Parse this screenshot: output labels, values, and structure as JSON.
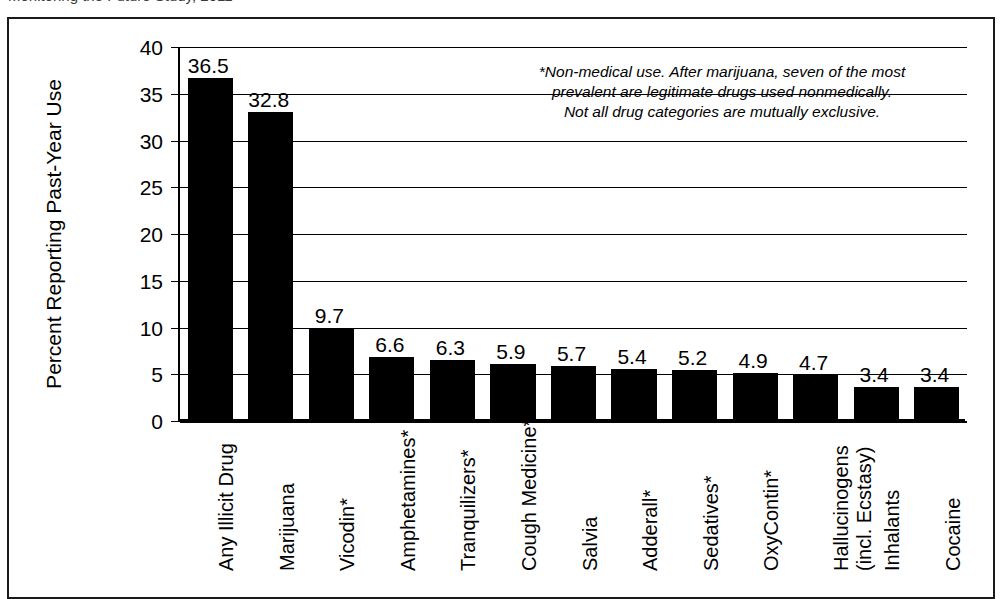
{
  "caption": {
    "text": "Monitoring the Future Study, 2011"
  },
  "chart_data": {
    "type": "bar",
    "title": "",
    "xlabel": "",
    "ylabel": "Percent Reporting Past-Year Use",
    "ylim": [
      0,
      40
    ],
    "ytick_step": 5,
    "yticks": [
      "0",
      "5",
      "10",
      "15",
      "20",
      "25",
      "30",
      "35",
      "40"
    ],
    "grid": true,
    "legend": "none",
    "bar_color": "#000000",
    "categories": [
      "Any Illicit Drug",
      "Marijuana",
      "Vicodin*",
      "Amphetamines*",
      "Tranquilizers*",
      "Cough Medicine*",
      "Salvia",
      "Adderall*",
      "Sedatives*",
      "OxyContin*",
      "Hallucinogens (incl. Ecstasy)",
      "Inhalants",
      "Cocaine"
    ],
    "category_lines": [
      [
        "Any Illicit Drug"
      ],
      [
        "Marijuana"
      ],
      [
        "Vicodin*"
      ],
      [
        "Amphetamines*"
      ],
      [
        "Tranquilizers*"
      ],
      [
        "Cough Medicine*"
      ],
      [
        "Salvia"
      ],
      [
        "Adderall*"
      ],
      [
        "Sedatives*"
      ],
      [
        "OxyContin*"
      ],
      [
        "Hallucinogens",
        "(incl. Ecstasy)"
      ],
      [
        "Inhalants"
      ],
      [
        "Cocaine"
      ]
    ],
    "values": [
      36.5,
      32.8,
      9.7,
      6.6,
      6.3,
      5.9,
      5.7,
      5.4,
      5.2,
      4.9,
      4.7,
      3.4,
      3.4
    ],
    "value_labels": [
      "36.5",
      "32.8",
      "9.7",
      "6.6",
      "6.3",
      "5.9",
      "5.7",
      "5.4",
      "5.2",
      "4.9",
      "4.7",
      "3.4",
      "3.4"
    ],
    "annotation": {
      "line1": "*Non-medical use. After marijuana, seven of the most",
      "line2": "prevalent are legitimate drugs used nonmedically.",
      "line3": "Not all drug categories are mutually exclusive."
    }
  }
}
